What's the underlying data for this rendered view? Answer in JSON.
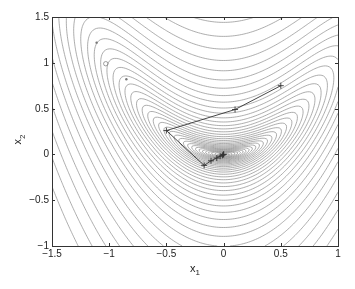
{
  "chart_data": {
    "type": "contour",
    "title": "",
    "xlabel": "x",
    "xlabel_sub": "1",
    "ylabel": "x",
    "ylabel_sub": "2",
    "xlim": [
      -1.5,
      1
    ],
    "ylim": [
      -1,
      1.5
    ],
    "xticks": [
      {
        "value": -1.5,
        "label": "−1.5"
      },
      {
        "value": -1,
        "label": "−1"
      },
      {
        "value": -0.5,
        "label": "−0.5"
      },
      {
        "value": 0,
        "label": "0"
      },
      {
        "value": 0.5,
        "label": "0.5"
      },
      {
        "value": 1,
        "label": "1"
      }
    ],
    "yticks": [
      {
        "value": -1,
        "label": "−1"
      },
      {
        "value": -0.5,
        "label": "−0.5"
      },
      {
        "value": 0,
        "label": "0"
      },
      {
        "value": 0.5,
        "label": "0.5"
      },
      {
        "value": 1,
        "label": "1"
      },
      {
        "value": 1.5,
        "label": "1.5"
      }
    ],
    "grid": false,
    "legend": null,
    "contour": {
      "description": "Level curves of an objective with a curved valley toward the upper-left and minimum near (0,0)",
      "minimum": [
        0,
        0
      ],
      "num_levels": 40,
      "line_color": "#8a8a8a"
    },
    "series": [
      {
        "name": "iterates",
        "type": "line",
        "marker": "+",
        "color": "#333333",
        "x": [
          0.5,
          0.1,
          -0.5,
          -0.17,
          -0.11,
          -0.06,
          -0.03,
          -0.01,
          0.0,
          0.0
        ],
        "y": [
          0.75,
          0.49,
          0.26,
          -0.12,
          -0.07,
          -0.04,
          -0.02,
          -0.01,
          0.0,
          0.0
        ]
      }
    ],
    "annotations": [
      {
        "type": "dot",
        "x": -1.11,
        "y": 1.22
      },
      {
        "type": "small-circle",
        "x": -1.03,
        "y": 0.99
      },
      {
        "type": "dot",
        "x": -0.85,
        "y": 0.82
      }
    ]
  },
  "layout": {
    "plot_left": 52,
    "plot_top": 17,
    "plot_right": 338,
    "plot_bottom": 246
  }
}
